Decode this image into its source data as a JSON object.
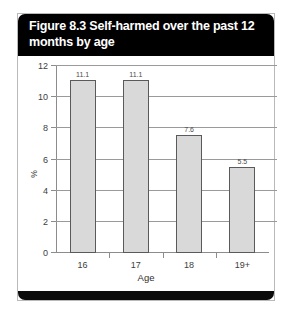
{
  "figure": {
    "title": "Figure 8.3 Self-harmed over the past 12 months by age"
  },
  "chart_data": {
    "type": "bar",
    "title": "Figure 8.3 Self-harmed over the past 12 months by age",
    "categories": [
      "16",
      "17",
      "18",
      "19+"
    ],
    "values": [
      11.1,
      11.1,
      7.6,
      5.5
    ],
    "value_labels": [
      "11.1",
      "11.1",
      "7.6",
      "5.5"
    ],
    "xlabel": "Age",
    "ylabel": "%",
    "ylim": [
      0,
      12
    ],
    "ytick_labels": [
      "0",
      "2",
      "4",
      "6",
      "8",
      "10",
      "12"
    ],
    "ytick_values": [
      0,
      2,
      4,
      6,
      8,
      10,
      12
    ],
    "grid": true,
    "legend": false,
    "bar_color": "#d9d9d9",
    "bar_border_color": "#5a5a5a",
    "banner_color": "#000000",
    "banner_text_color": "#ffffff"
  }
}
